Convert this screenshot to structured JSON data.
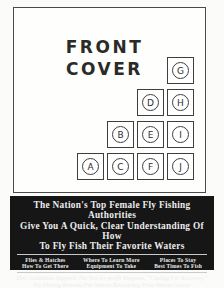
{
  "cover": {
    "title_line1": "FRONT",
    "title_line2": "COVER",
    "callouts": [
      "G",
      "D",
      "H",
      "B",
      "E",
      "I",
      "A",
      "C",
      "F",
      "J"
    ]
  },
  "banner": {
    "headline_line1": "The Nation's Top Female Fly Fishing Authorities",
    "headline_line2": "Give You A Quick, Clear Understanding Of How",
    "headline_line3": "To Fly Fish Their Favorite Waters",
    "columns": [
      {
        "line1": "Flies & Hatches",
        "line2": "How To Get There"
      },
      {
        "line1": "Where To Learn More",
        "line2": "Equipment To Take"
      },
      {
        "line1": "Places To Stay",
        "line2": "Best Times To Fish"
      }
    ],
    "footnote_line1": "This Guidebook Supports The Not-for-profit Program, “Casting For Recovery,”",
    "footnote_line2": "Fly Fishing Retreats For Women Recovering From Breast Cancer"
  },
  "colors": {
    "banner_bg": "#161616",
    "banner_text": "#ececec",
    "line_color": "#3e3e3e"
  }
}
